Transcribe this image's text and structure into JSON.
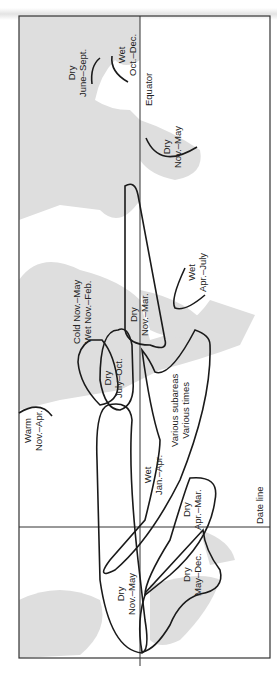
{
  "map": {
    "title": "Climatic season zones map (rotated)",
    "orientation": "rotated -90deg",
    "reference_lines": {
      "equator": "Equator",
      "date_line": "Date line"
    },
    "zones": [
      {
        "id": "dry-june-sept",
        "line1": "Dry",
        "line2": "June–Sept."
      },
      {
        "id": "wet-oct-dec",
        "line1": "Wet",
        "line2": "Oct.–Dec."
      },
      {
        "id": "dry-nov-may-africa",
        "line1": "Dry",
        "line2": "Nov.–May"
      },
      {
        "id": "cold-nov-may",
        "line1": "Cold Nov.–May",
        "line2": "Wet Nov.–Feb."
      },
      {
        "id": "dry-nov-mar",
        "line1": "Dry",
        "line2": "Nov.–Mar."
      },
      {
        "id": "wet-apr-july",
        "line1": "Wet",
        "line2": "Apr.–July"
      },
      {
        "id": "dry-july-oct",
        "line1": "Dry",
        "line2": "July–Oct."
      },
      {
        "id": "various",
        "line1": "Various subareas",
        "line2": "Various times"
      },
      {
        "id": "warm-nov-apr",
        "line1": "Warm",
        "line2": "Nov.–Apr."
      },
      {
        "id": "wet-jan-apr",
        "line1": "Wet",
        "line2": "Jan.–Apr."
      },
      {
        "id": "dry-apr-mar",
        "line1": "Dry",
        "line2": "Apr.–Mar."
      },
      {
        "id": "dry-nov-may-pacific",
        "line1": "Dry",
        "line2": "Nov.–May"
      },
      {
        "id": "dry-may-dec",
        "line1": "Dry",
        "line2": "May–Dec."
      }
    ],
    "colors": {
      "land": "#dcdcdc",
      "ocean": "#ffffff",
      "lines": "#1a1a1a",
      "frame": "#333333"
    }
  }
}
